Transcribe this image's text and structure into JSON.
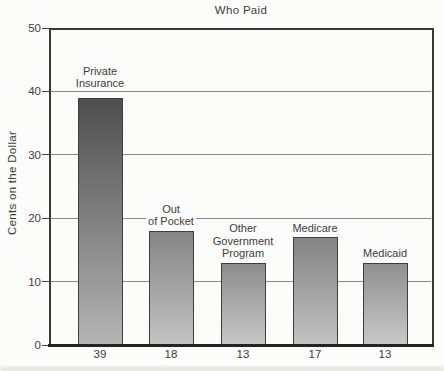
{
  "chart_data": {
    "type": "bar",
    "title": "Who Paid",
    "xlabel": "",
    "ylabel": "Cents on the Dollar",
    "ylim": [
      0,
      50
    ],
    "y_ticks": [
      0,
      10,
      20,
      30,
      40,
      50
    ],
    "gridlines_at": [
      10,
      20,
      30,
      40
    ],
    "grid": "horizontal",
    "legend": "none",
    "categories": [
      "Private Insurance",
      "Out of Pocket",
      "Other Government Program",
      "Medicare",
      "Medicaid"
    ],
    "values": [
      39,
      18,
      13,
      17,
      13
    ],
    "bars": [
      {
        "label": "Private\nInsurance",
        "value": 39,
        "value_label": "39",
        "color_top": "#4e4e4e",
        "color_bottom": "#b5b5b5"
      },
      {
        "label": "Out\nof Pocket",
        "value": 18,
        "value_label": "18",
        "color_top": "#858585",
        "color_bottom": "#c3c3c3"
      },
      {
        "label": "Other\nGovernment\nProgram",
        "value": 13,
        "value_label": "13",
        "color_top": "#8d8d8d",
        "color_bottom": "#c7c7c7"
      },
      {
        "label": "Medicare",
        "value": 17,
        "value_label": "17",
        "color_top": "#848484",
        "color_bottom": "#c2c2c2"
      },
      {
        "label": "Medicaid",
        "value": 13,
        "value_label": "13",
        "color_top": "#909090",
        "color_bottom": "#c8c8c8"
      }
    ],
    "colors": {
      "background": "#fcfcfb",
      "axis": "#3a3a3a",
      "baseline": "#242424",
      "gridline": "#8a8a8a",
      "text": "#3d3d3d",
      "bar_outline": "#3e3e3e"
    }
  }
}
